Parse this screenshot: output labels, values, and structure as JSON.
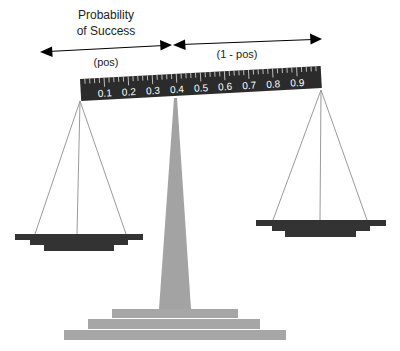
{
  "diagram": {
    "title_line1": "Probability",
    "title_line2": "of Success",
    "left_label": "(pos)",
    "right_label": "(1 - pos)",
    "ruler": {
      "tick_labels": [
        "0.1",
        "0.2",
        "0.3",
        "0.4",
        "0.5",
        "0.6",
        "0.7",
        "0.8",
        "0.9"
      ],
      "color": "#2b2b2b"
    },
    "colors": {
      "pan": "#333333",
      "pillar": "#a3a3a3",
      "base": "#a6a6a6",
      "string": "#999999",
      "arrow": "#000000"
    }
  }
}
